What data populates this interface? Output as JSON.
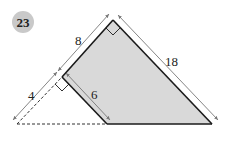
{
  "problem_number": "23",
  "labels": {
    "top_left_side": "8",
    "top_right_side": "18",
    "left_extension": "4",
    "inner_height": "6"
  },
  "colors": {
    "shade": "#d9d9d9",
    "stroke": "#1a1a1a",
    "dim": "#777777",
    "badge": "#c9c9c9"
  }
}
